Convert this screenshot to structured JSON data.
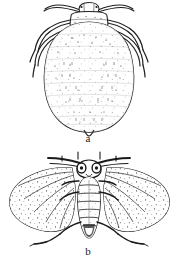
{
  "plate": {
    "title": "Insect illustration plate",
    "background_color": "#ffffff",
    "ink_color": "#1a1a1a",
    "style": "black-and-white line engraving"
  },
  "figures": [
    {
      "id": "figure-a",
      "label": "a",
      "caption": "a",
      "subject": "wingless aphid, dorsal view",
      "label_position": {
        "x": 88,
        "y": 138
      }
    },
    {
      "id": "figure-b",
      "label": "b",
      "caption": "b",
      "subject": "winged adult aphid with spread wings, dorsal view",
      "label_position": {
        "x": 88,
        "y": 252
      }
    }
  ],
  "icons": {
    "aphid_nymph": "aphid-dorsal-icon",
    "aphid_winged": "winged-aphid-dorsal-icon"
  }
}
